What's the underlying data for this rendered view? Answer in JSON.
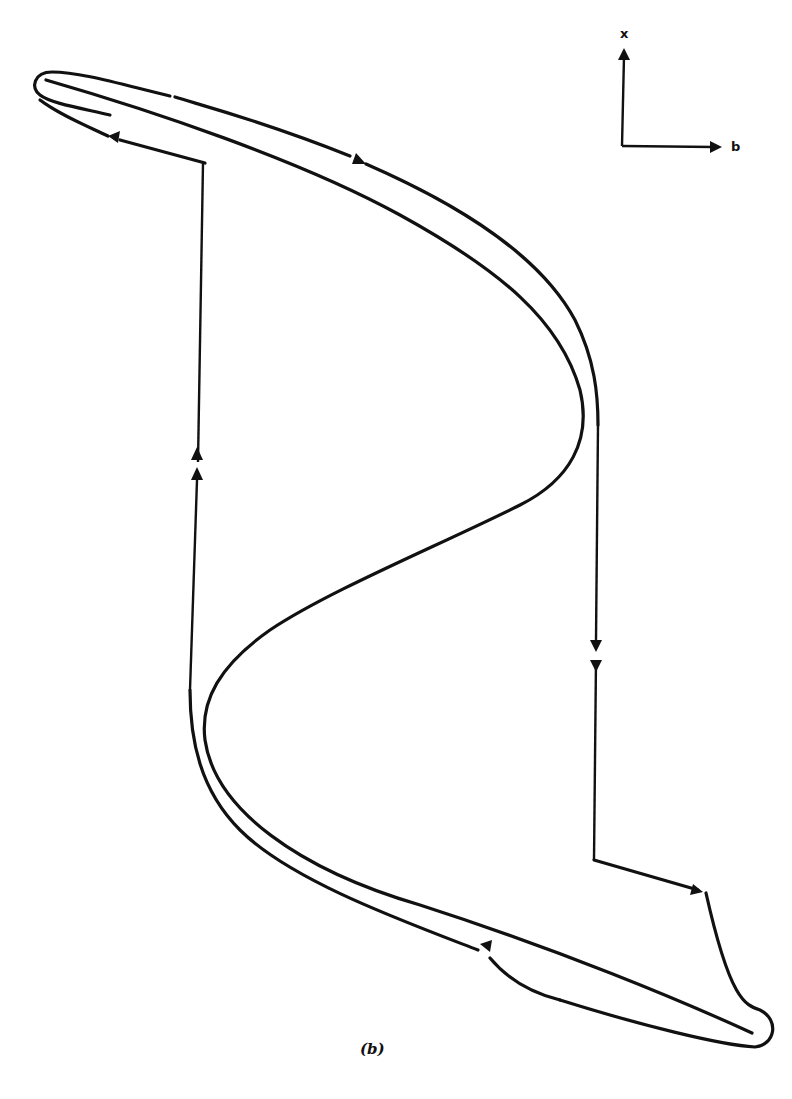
{
  "figure": {
    "caption": "(b)",
    "axes": {
      "vertical_label": "x",
      "horizontal_label": "b"
    },
    "elements": [
      {
        "name": "s-curve",
        "type": "curve"
      },
      {
        "name": "upper-branch-path",
        "direction": "right",
        "arrows": 2
      },
      {
        "name": "right-jump-down",
        "direction": "down",
        "arrows": 2
      },
      {
        "name": "lower-branch-path",
        "direction": "left/right",
        "arrows": 2
      },
      {
        "name": "left-jump-up",
        "direction": "up",
        "arrows": 2
      }
    ],
    "colors": {
      "ink": "#111111",
      "background": "#ffffff"
    }
  }
}
